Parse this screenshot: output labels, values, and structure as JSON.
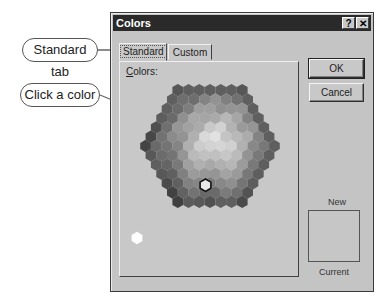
{
  "dialog": {
    "title": "Colors",
    "help_button": "?",
    "close_button": "✕",
    "tabs": [
      {
        "label": "Standard",
        "active": true
      },
      {
        "label": "Custom",
        "active": false
      }
    ],
    "colors_label_accel": "C",
    "colors_label_rest": "olors:",
    "ok_label": "OK",
    "cancel_label": "Cancel",
    "new_label": "New",
    "current_label": "Current"
  },
  "callouts": [
    {
      "label": "Standard tab"
    },
    {
      "label": "Click a color"
    }
  ],
  "palette": {
    "selected_cell": "row 8, col 3",
    "grayscale_swatches": [
      "#ffffff",
      "#e8e8e8",
      "#dcdcdc",
      "#d0d0d0",
      "#bcbcbc",
      "#a8a8a8",
      "#8a8a8a",
      "#707070",
      "#555555",
      "#3c3c3c",
      "#262626",
      "#141414",
      "#000000"
    ]
  }
}
